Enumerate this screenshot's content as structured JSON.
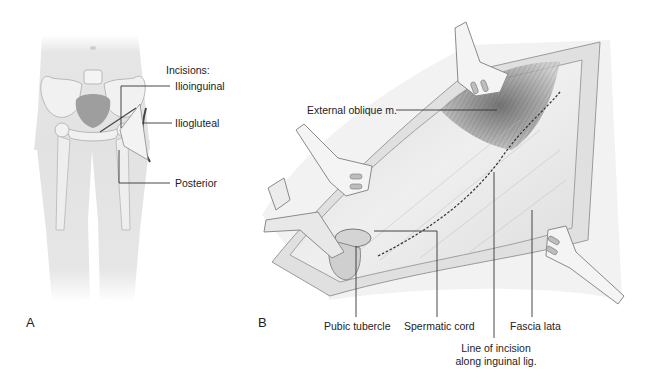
{
  "panel_a": {
    "letter": "A",
    "heading": "Incisions:",
    "labels": {
      "ilioinguinal": "Ilioinguinal",
      "iliogluteal": "Iliogluteal",
      "posterior": "Posterior"
    }
  },
  "panel_b": {
    "letter": "B",
    "labels": {
      "external_oblique": "External oblique m.",
      "pubic_tubercle": "Pubic tubercle",
      "spermatic_cord": "Spermatic cord",
      "fascia_lata": "Fascia lata",
      "incision_line_1": "Line of incision",
      "incision_line_2": "along inguinal lig."
    }
  },
  "colors": {
    "background": "#ffffff",
    "body": "#e4e4e4",
    "bone": "#f2f2f2",
    "bone_outline": "#b8b8b8",
    "pelvis_shadow": "#9a9a9a",
    "tissue": "#ececec",
    "muscle_dark": "#6a6a6a",
    "leader_line": "#333333"
  }
}
